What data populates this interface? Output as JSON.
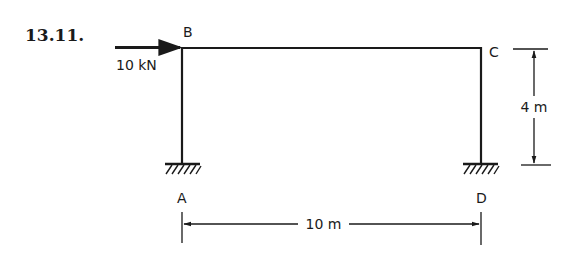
{
  "problem": {
    "number": "13.11."
  },
  "frame": {
    "joints": [
      {
        "id": "A",
        "label": "A",
        "support": "fixed"
      },
      {
        "id": "B",
        "label": "B"
      },
      {
        "id": "C",
        "label": "C"
      },
      {
        "id": "D",
        "label": "D",
        "support": "fixed"
      }
    ],
    "members": [
      {
        "from": "A",
        "to": "B",
        "type": "column"
      },
      {
        "from": "B",
        "to": "C",
        "type": "beam"
      },
      {
        "from": "C",
        "to": "D",
        "type": "column"
      }
    ]
  },
  "loads": [
    {
      "at": "B",
      "direction": "right",
      "label": "10 kN"
    }
  ],
  "dimensions": {
    "span": {
      "label": "10 m",
      "between": [
        "A",
        "D"
      ]
    },
    "height": {
      "label": "4 m",
      "between": [
        "C",
        "D"
      ]
    }
  },
  "colors": {
    "ink": "#1a1a1a",
    "background": "#ffffff"
  }
}
